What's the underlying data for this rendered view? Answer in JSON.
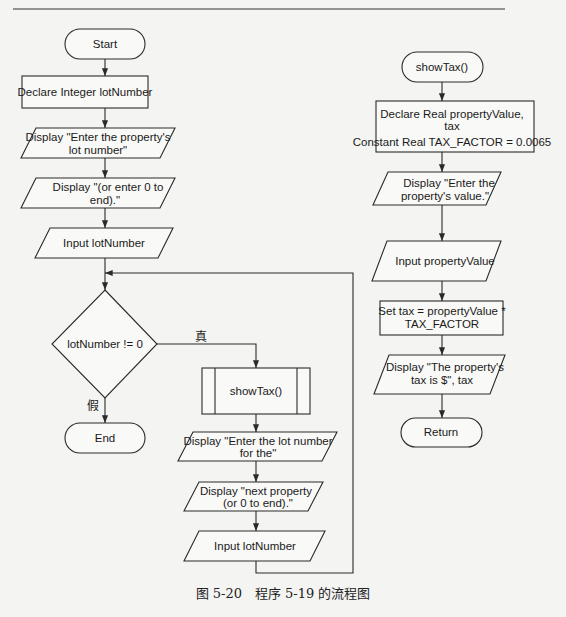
{
  "main_flow": {
    "start": "Start",
    "declare": "Declare Integer lotNumber",
    "display1": [
      "Display \"Enter the property's",
      "lot number\""
    ],
    "display2": [
      "Display \"(or enter 0 to",
      "end).\""
    ],
    "input1": "Input lotNumber",
    "decision": "lotNumber != 0",
    "true_label": "真",
    "false_label": "假",
    "call": "showTax()",
    "display3": [
      "Display \"Enter the lot number",
      "for the\""
    ],
    "display4": [
      "Display \"next property",
      "(or 0 to end).\""
    ],
    "input2": "Input lotNumber",
    "end": "End"
  },
  "module_flow": {
    "start": "showTax()",
    "declare": [
      "Declare Real propertyValue,",
      "tax",
      "Constant Real TAX_FACTOR = 0.0065"
    ],
    "display1": [
      "Display \"Enter the",
      "property's value.\""
    ],
    "input": "Input propertyValue",
    "set": [
      "Set tax = propertyValue *",
      "TAX_FACTOR"
    ],
    "display2": [
      "Display \"The property's",
      "tax is $\", tax"
    ],
    "return": "Return"
  },
  "caption": "图 5-20　程序 5-19 的流程图"
}
